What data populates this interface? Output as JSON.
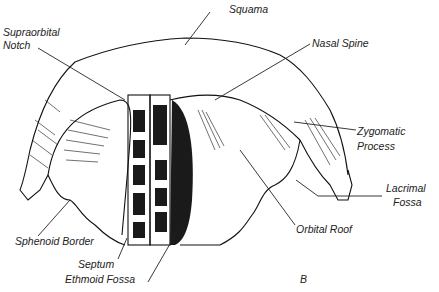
{
  "figure": {
    "panel_letter": "B",
    "labels": [
      {
        "id": "squama",
        "text": "Squama"
      },
      {
        "id": "supraorbital-notch",
        "text": "Supraorbital\nNotch",
        "line1": "Supraorbital",
        "line2": "Notch"
      },
      {
        "id": "nasal-spine",
        "text": "Nasal Spine"
      },
      {
        "id": "zygomatic-process",
        "line1": "Zygomatic",
        "line2": "Process"
      },
      {
        "id": "lacrimal-fossa",
        "line1": "Lacrimal",
        "line2": "Fossa"
      },
      {
        "id": "orbital-roof",
        "text": "Orbital Roof"
      },
      {
        "id": "sphenoid-border",
        "text": "Sphenoid Border"
      },
      {
        "id": "septum",
        "text": "Septum"
      },
      {
        "id": "ethmoid-fossa",
        "text": "Ethmoid Fossa"
      }
    ],
    "colors": {
      "ink": "#1a1a1a",
      "background": "#ffffff"
    }
  }
}
